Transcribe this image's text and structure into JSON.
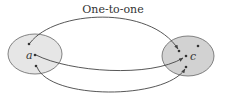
{
  "diagram": {
    "title": "One-to-one",
    "left_set": {
      "label": "a",
      "fill": "#e6e6e6",
      "stroke": "#555555",
      "points": [
        {
          "x": 29,
          "y": 44
        },
        {
          "x": 35,
          "y": 55
        },
        {
          "x": 36,
          "y": 66
        }
      ]
    },
    "right_set": {
      "label": "c",
      "fill": "#d2d2d2",
      "stroke": "#555555",
      "points": [
        {
          "x": 179,
          "y": 51
        },
        {
          "x": 198,
          "y": 46
        },
        {
          "x": 186,
          "y": 56
        },
        {
          "x": 186,
          "y": 67
        }
      ]
    },
    "arrows": [
      {
        "from": "left-top",
        "to": "right-upper"
      },
      {
        "from": "left-middle",
        "to": "right-middle"
      },
      {
        "from": "left-bottom",
        "to": "right-bottom"
      }
    ],
    "line_color": "#444444"
  }
}
